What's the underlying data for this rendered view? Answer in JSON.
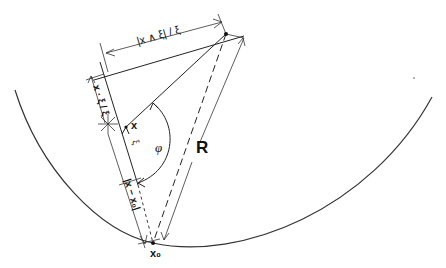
{
  "diagram": {
    "labels": {
      "top_dimension": "|x ∧ ξ| / ξ",
      "left_dimension": "x · ξ / ξ",
      "point_x": "x",
      "point_x0": "x₀",
      "xi_vector": "ξ",
      "angle": "φ",
      "radius": "R",
      "lower_dimension": "|x − x₀|"
    },
    "points": {
      "P": [
        226,
        34
      ],
      "x": [
        126,
        127
      ],
      "x0": [
        153,
        243
      ],
      "origin": [
        108,
        124
      ]
    },
    "colors": {
      "stroke": "#222222",
      "background": "#ffffff"
    }
  }
}
